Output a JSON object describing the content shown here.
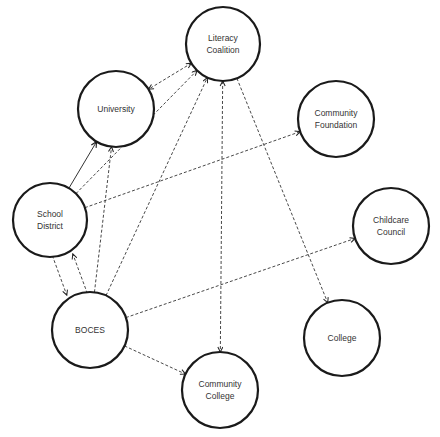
{
  "diagram": {
    "type": "network",
    "nodes": [
      {
        "id": "literacy",
        "lines": [
          "Literacy",
          "Coalition"
        ],
        "cx": 223,
        "cy": 44,
        "r": 37
      },
      {
        "id": "university",
        "lines": [
          "University"
        ],
        "cx": 116,
        "cy": 109,
        "r": 38
      },
      {
        "id": "foundation",
        "lines": [
          "Community",
          "Foundation"
        ],
        "cx": 336,
        "cy": 119,
        "r": 38
      },
      {
        "id": "school",
        "lines": [
          "School",
          "District"
        ],
        "cx": 50,
        "cy": 220,
        "r": 37
      },
      {
        "id": "childcare",
        "lines": [
          "Childcare",
          "Council"
        ],
        "cx": 391,
        "cy": 226,
        "r": 38
      },
      {
        "id": "boces",
        "lines": [
          "BOCES"
        ],
        "cx": 90,
        "cy": 330,
        "r": 38
      },
      {
        "id": "college",
        "lines": [
          "College"
        ],
        "cx": 342,
        "cy": 338,
        "r": 38
      },
      {
        "id": "ccollege",
        "lines": [
          "Community",
          "College"
        ],
        "cx": 220,
        "cy": 390,
        "r": 38
      }
    ],
    "edges": [
      {
        "from": "literacy",
        "to": "university",
        "style": "dashed",
        "bidirectional": true
      },
      {
        "from": "school",
        "to": "university",
        "style": "solid",
        "bidirectional": false
      },
      {
        "from": "school",
        "to": "literacy",
        "style": "dashed",
        "bidirectional": false
      },
      {
        "from": "school",
        "to": "foundation",
        "style": "dashed",
        "bidirectional": false
      },
      {
        "from": "school",
        "to": "boces",
        "style": "dashed",
        "bidirectional": false
      },
      {
        "from": "boces",
        "to": "school",
        "style": "dashed",
        "bidirectional": false
      },
      {
        "from": "boces",
        "to": "university",
        "style": "dashed",
        "bidirectional": false
      },
      {
        "from": "boces",
        "to": "literacy",
        "style": "dashed",
        "bidirectional": false
      },
      {
        "from": "boces",
        "to": "childcare",
        "style": "dashed",
        "bidirectional": false
      },
      {
        "from": "boces",
        "to": "ccollege",
        "style": "dashed",
        "bidirectional": false
      },
      {
        "from": "literacy",
        "to": "ccollege",
        "style": "dashed",
        "bidirectional": true
      },
      {
        "from": "literacy",
        "to": "college",
        "style": "dashed",
        "bidirectional": false
      }
    ]
  }
}
